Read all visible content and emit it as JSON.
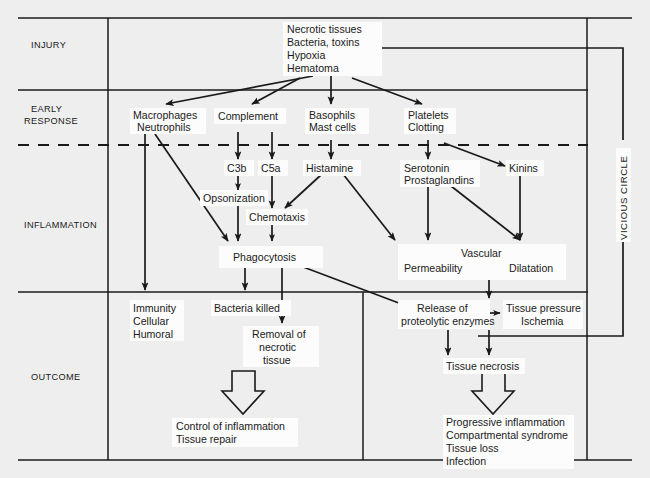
{
  "diagram": {
    "title_region": "inflammation-cascade",
    "stages": [
      {
        "id": "injury",
        "label": "INJURY"
      },
      {
        "id": "early-response",
        "label": "EARLY\nRESPONSE"
      },
      {
        "id": "inflammation",
        "label": "INFLAMMATION"
      },
      {
        "id": "outcome",
        "label": "OUTCOME"
      }
    ],
    "stage_labels": {
      "injury": "INJURY",
      "early_response_line1": "EARLY",
      "early_response_line2": "RESPONSE",
      "inflammation": "INFLAMMATION",
      "outcome": "OUTCOME"
    },
    "vicious_circle_label": "VICIOUS CIRCLE",
    "nodes": {
      "trigger": {
        "lines": [
          "Necrotic tissues",
          "Bacteria, toxins",
          "Hypoxia",
          "Hematoma"
        ]
      },
      "macrophages": {
        "lines": [
          "Macrophages",
          "Neutrophils"
        ]
      },
      "complement": {
        "lines": [
          "Complement"
        ]
      },
      "basophils": {
        "lines": [
          "Basophils",
          "Mast cells"
        ]
      },
      "platelets": {
        "lines": [
          "Platelets",
          "Clotting"
        ]
      },
      "c3b": {
        "lines": [
          "C3b"
        ]
      },
      "c5a": {
        "lines": [
          "C5a"
        ]
      },
      "histamine": {
        "lines": [
          "Histamine"
        ]
      },
      "serotonin": {
        "lines": [
          "Serotonin",
          "Prostaglandins"
        ]
      },
      "kinins": {
        "lines": [
          "Kinins"
        ]
      },
      "opsonization": {
        "lines": [
          "Opsonization"
        ]
      },
      "chemotaxis": {
        "lines": [
          "Chemotaxis"
        ]
      },
      "phagocytosis": {
        "lines": [
          "Phagocytosis"
        ]
      },
      "vascular": {
        "lines": [
          "Vascular"
        ]
      },
      "permeability": {
        "lines": [
          "Permeability"
        ]
      },
      "dilatation": {
        "lines": [
          "Dilatation"
        ]
      },
      "immunity": {
        "lines": [
          "Immunity",
          "Cellular",
          "Humoral"
        ]
      },
      "bacteria_killed": {
        "lines": [
          "Bacteria killed"
        ]
      },
      "removal": {
        "lines": [
          "Removal of",
          "necrotic",
          "tissue"
        ]
      },
      "release_enzymes": {
        "lines": [
          "Release of",
          "proteolytic enzymes"
        ]
      },
      "tissue_pressure": {
        "lines": [
          "Tissue pressure",
          "Ischemia"
        ]
      },
      "tissue_necrosis": {
        "lines": [
          "Tissue necrosis"
        ]
      },
      "good_outcome": {
        "lines": [
          "Control of inflammation",
          "Tissue repair"
        ]
      },
      "bad_outcome": {
        "lines": [
          "Progressive inflammation",
          "Compartmental syndrome",
          "Tissue loss",
          "Infection"
        ]
      }
    },
    "colors": {
      "background": "#eeeeee",
      "ink": "#1a1a1a",
      "node_fill": "#fcfcfc"
    }
  }
}
